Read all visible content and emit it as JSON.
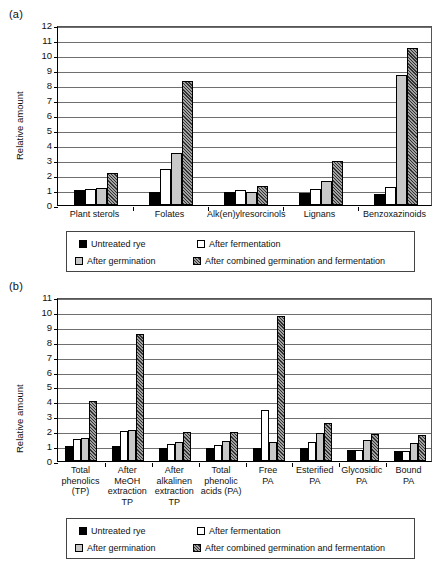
{
  "figure": {
    "panel_a_label": "(a)",
    "panel_b_label": "(b)"
  },
  "series_styles": {
    "untreated": "#000000",
    "fermentation": "#ffffff",
    "germination": "#c8c8c8",
    "combined": "#6e6e6e"
  },
  "legend": {
    "items": [
      {
        "label": "Untreated rye",
        "swatch": "black-filled-square-icon"
      },
      {
        "label": "After fermentation",
        "swatch": "white-square-icon"
      },
      {
        "label": "After germination",
        "swatch": "light-gray-square-icon"
      },
      {
        "label": "After combined germination and fermentation",
        "swatch": "dark-hatched-square-icon"
      }
    ]
  },
  "chart_data": [
    {
      "panel": "(a)",
      "type": "bar",
      "title": "",
      "xlabel": "",
      "ylabel": "Relative amount",
      "ylim": [
        0,
        12
      ],
      "yticks": [
        0,
        1,
        2,
        3,
        4,
        5,
        6,
        7,
        8,
        9,
        10,
        11,
        12
      ],
      "grid": true,
      "legend_position": "bottom",
      "categories": [
        "Plant sterols",
        "Folates",
        "Alk(en)ylresorcinols",
        "Lignans",
        "Benzoxazinoids"
      ],
      "series": [
        {
          "name": "Untreated rye",
          "values": [
            1.0,
            0.9,
            0.85,
            0.8,
            0.75
          ]
        },
        {
          "name": "After fermentation",
          "values": [
            1.05,
            2.4,
            1.0,
            1.1,
            1.2
          ]
        },
        {
          "name": "After germination",
          "values": [
            1.15,
            3.5,
            0.85,
            1.6,
            8.7
          ]
        },
        {
          "name": "After combined germination and fermentation",
          "values": [
            2.15,
            8.25,
            1.25,
            2.95,
            10.5
          ]
        }
      ]
    },
    {
      "panel": "(b)",
      "type": "bar",
      "title": "",
      "xlabel": "",
      "ylabel": "Relative amount",
      "ylim": [
        0,
        11
      ],
      "yticks": [
        0,
        1,
        2,
        3,
        4,
        5,
        6,
        7,
        8,
        9,
        10,
        11
      ],
      "grid": true,
      "legend_position": "bottom",
      "categories": [
        "Total\nphenolics\n(TP)",
        "After\nMeOH\nextraction\nTP",
        "After\nalkalinen\nextraction\nTP",
        "Total\nphenolic\nacids (PA)",
        "Free\nPA",
        "Esterified\nPA",
        "Glycosidic\nPA",
        "Bound\nPA"
      ],
      "series": [
        {
          "name": "Untreated rye",
          "values": [
            1.0,
            0.98,
            0.9,
            0.88,
            0.85,
            0.85,
            0.75,
            0.7
          ]
        },
        {
          "name": "After fermentation",
          "values": [
            1.48,
            2.0,
            1.15,
            1.05,
            3.45,
            1.3,
            0.72,
            0.68
          ]
        },
        {
          "name": "After germination",
          "values": [
            1.55,
            2.1,
            1.3,
            1.32,
            1.3,
            1.88,
            1.42,
            1.18
          ]
        },
        {
          "name": "After combined germination and fermentation",
          "values": [
            4.05,
            8.55,
            1.92,
            1.95,
            9.75,
            2.55,
            1.82,
            1.75
          ]
        }
      ]
    }
  ]
}
